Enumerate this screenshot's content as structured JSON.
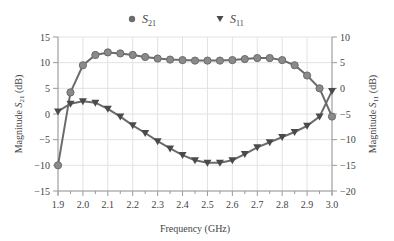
{
  "chart_data": {
    "type": "line",
    "title": "",
    "xlabel": "Frequency (GHz)",
    "ylabel_left": "Magnitude S21 (dB)",
    "ylabel_right": "Magnitude S11 (dB)",
    "xlim": [
      1.9,
      3.0
    ],
    "ylim_left": [
      -15,
      15
    ],
    "ylim_right": [
      -20,
      10
    ],
    "x_ticks": [
      "1.9",
      "2.0",
      "2.1",
      "2.2",
      "2.3",
      "2.4",
      "2.5",
      "2.6",
      "2.7",
      "2.8",
      "2.9",
      "3.0"
    ],
    "y_ticks_left": [
      "15",
      "10",
      "5",
      "0",
      "−5",
      "−10",
      "−15"
    ],
    "y_ticks_right": [
      "10",
      "5",
      "0",
      "−5",
      "−10",
      "−15",
      "−20"
    ],
    "grid": true,
    "legend_position": "top",
    "x": [
      1.9,
      1.95,
      2.0,
      2.05,
      2.1,
      2.15,
      2.2,
      2.25,
      2.3,
      2.35,
      2.4,
      2.45,
      2.5,
      2.55,
      2.6,
      2.65,
      2.7,
      2.75,
      2.8,
      2.85,
      2.9,
      2.95,
      3.0
    ],
    "series": [
      {
        "name": "S21",
        "axis": "left",
        "marker": "circle",
        "values": [
          -10,
          4.2,
          9.5,
          11.5,
          12,
          11.8,
          11.5,
          11.1,
          10.8,
          10.6,
          10.5,
          10.4,
          10.4,
          10.4,
          10.5,
          10.7,
          10.9,
          10.9,
          10.5,
          9.5,
          7.5,
          5,
          -0.5
        ]
      },
      {
        "name": "S11",
        "axis": "right",
        "marker": "triangle-down",
        "values": [
          -4.5,
          -3,
          -2.5,
          -2.8,
          -4,
          -5.5,
          -7.2,
          -8.7,
          -10.3,
          -11.7,
          -13,
          -14,
          -14.5,
          -14.5,
          -14,
          -12.8,
          -11.5,
          -10.5,
          -9.5,
          -8.5,
          -7.3,
          -5.5,
          -0.5
        ]
      }
    ]
  },
  "legend": {
    "s21_main": "S",
    "s21_sub": "21",
    "s11_main": "S",
    "s11_sub": "11"
  },
  "colors": {
    "line": "#6b6b6b",
    "marker_fill": "#8a8a8a",
    "triangle_fill": "#4a4a4a",
    "grid": "#e2e2e2",
    "axis": "#9a9a9a",
    "text": "#444444"
  }
}
